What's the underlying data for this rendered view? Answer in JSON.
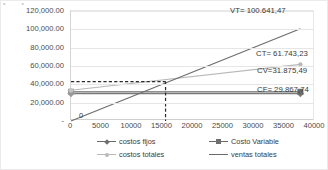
{
  "chart_data": {
    "type": "line",
    "title": "",
    "xlabel": "",
    "ylabel": "",
    "xlim": [
      0,
      40000
    ],
    "ylim": [
      0,
      120000
    ],
    "grid": true,
    "legend_position": "bottom",
    "y_ticks": [
      "120,000.00",
      "100,000.00",
      "80,000.00",
      "60,000.00",
      "40,000.00",
      "20,000.00",
      "-"
    ],
    "y_tick_values": [
      120000,
      100000,
      80000,
      60000,
      40000,
      20000,
      0
    ],
    "x_ticks": [
      "0",
      "5000",
      "10000",
      "15000",
      "20000",
      "25000",
      "30000",
      "35000",
      "40000"
    ],
    "x_tick_values": [
      0,
      5000,
      10000,
      15000,
      20000,
      25000,
      30000,
      35000,
      40000
    ],
    "series": [
      {
        "name": "costos fijos",
        "key_style": "line-diamond",
        "color": "#7a7a7a",
        "x": [
          0,
          37600
        ],
        "values": [
          29867.74,
          29867.74
        ]
      },
      {
        "name": "Costo Variable",
        "key_style": "line-square",
        "color": "#6a6a6a",
        "x": [
          0,
          37600
        ],
        "values": [
          31875.49,
          31875.49
        ]
      },
      {
        "name": "costos totales",
        "key_style": "line-circle-light",
        "color": "#b9b9b9",
        "x": [
          0,
          37600
        ],
        "values": [
          33500.0,
          61743.23
        ]
      },
      {
        "name": "ventas totales",
        "key_style": "line-plain",
        "color": "#6f6f6f",
        "x": [
          0,
          37600
        ],
        "values": [
          0,
          100641.47
        ]
      }
    ],
    "annotations": [
      {
        "name": "vt-label",
        "text": "VT= 100.641,47",
        "x": 37600,
        "y": 100641.47
      },
      {
        "name": "ct-label",
        "text": "CT=  61.743,23",
        "x": 37600,
        "y": 61743.23
      },
      {
        "name": "cv-label",
        "text": "CV=31.875,49",
        "x": 37600,
        "y": 31875.49
      },
      {
        "name": "cf-label",
        "text": "CF= 29.867,74",
        "x": 37600,
        "y": 29867.74
      },
      {
        "name": "origin-label",
        "text": "0",
        "x": 0,
        "y": 0
      }
    ],
    "breakeven": {
      "x": 15500,
      "y": 43000,
      "guide_style": "dashed"
    }
  },
  "top_remnant": {
    "marks": [
      "•",
      "•"
    ]
  }
}
